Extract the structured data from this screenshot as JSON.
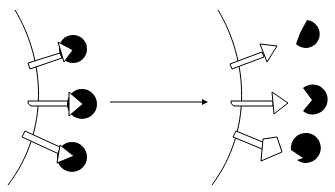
{
  "diagram": {
    "colors": {
      "stroke": "#000000",
      "ligand_fill": "#000000",
      "receptor_fill": "#ffffff",
      "background": "#ffffff"
    },
    "panels": [
      {
        "name": "bound-state",
        "membrane": "curved-line",
        "receptors": [
          {
            "label": "receptor-top",
            "ligand_bound": true
          },
          {
            "label": "receptor-middle",
            "ligand_bound": true
          },
          {
            "label": "receptor-bottom",
            "ligand_bound": true
          }
        ]
      },
      {
        "name": "released-state",
        "membrane": "curved-line",
        "receptors": [
          {
            "label": "receptor-top",
            "ligand_bound": false
          },
          {
            "label": "receptor-middle",
            "ligand_bound": false
          },
          {
            "label": "receptor-bottom",
            "ligand_bound": false
          }
        ]
      }
    ],
    "transition_arrow": {
      "direction": "right"
    }
  }
}
